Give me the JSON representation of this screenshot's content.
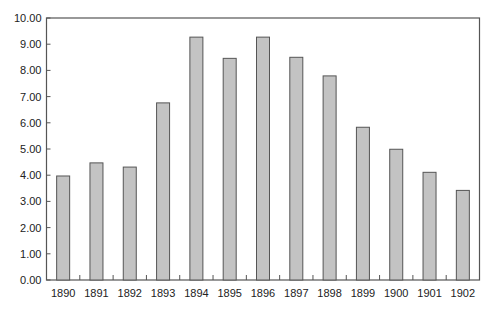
{
  "chart_data": {
    "type": "bar",
    "title": "",
    "xlabel": "",
    "ylabel": "",
    "categories": [
      "1890",
      "1891",
      "1892",
      "1893",
      "1894",
      "1895",
      "1896",
      "1897",
      "1898",
      "1899",
      "1900",
      "1901",
      "1902"
    ],
    "values": [
      3.97,
      4.47,
      4.31,
      6.76,
      9.27,
      8.46,
      9.27,
      8.5,
      7.79,
      5.83,
      4.99,
      4.11,
      3.42
    ],
    "ylim": [
      0,
      10
    ],
    "yticks": [
      "0.00",
      "1.00",
      "2.00",
      "3.00",
      "4.00",
      "5.00",
      "6.00",
      "7.00",
      "8.00",
      "9.00",
      "10.00"
    ],
    "grid": false,
    "legend": null
  },
  "colors": {
    "bar_fill": "#c3c3c3",
    "bar_stroke": "#555555",
    "axis": "#555555"
  }
}
